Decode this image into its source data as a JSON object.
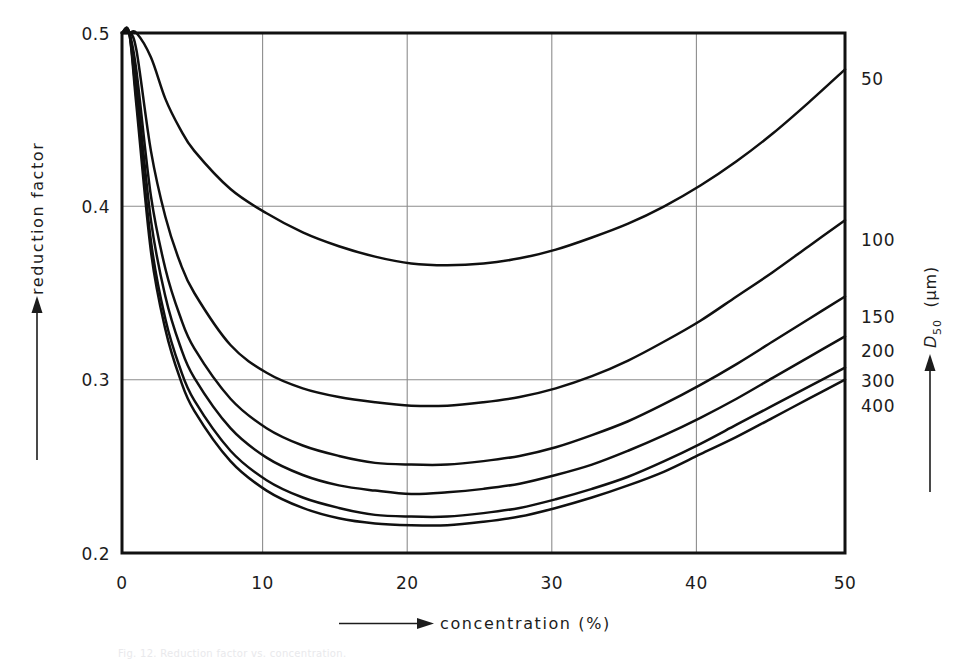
{
  "figure": {
    "caption": "Fig. 12. Reduction factor vs. concentration.",
    "background_color": "#ffffff",
    "line_color": "#101010",
    "grid_color": "#8d8d8d"
  },
  "axes": {
    "x_title": "concentration  (%)",
    "y_title": "reduction factor",
    "right_title_main": "D",
    "right_title_sub": "50",
    "right_title_unit": "(µm)",
    "x_ticks": [
      "0",
      "10",
      "20",
      "30",
      "40",
      "50"
    ],
    "y_ticks": [
      "0.5",
      "0.4",
      "0.3",
      "0.2"
    ],
    "series_labels": [
      "50",
      "100",
      "150",
      "200",
      "300",
      "400"
    ]
  },
  "chart_data": {
    "type": "line",
    "title": "",
    "xlabel": "concentration (%)",
    "ylabel": "reduction factor",
    "xlim": [
      0,
      50
    ],
    "ylim": [
      0.2,
      0.5
    ],
    "xticks": [
      0,
      10,
      20,
      30,
      40,
      50
    ],
    "yticks": [
      0.2,
      0.3,
      0.4,
      0.5
    ],
    "grid": true,
    "legend": "right-edge curve labels (D50 in micrometres)",
    "legend_position": "right",
    "series_unit": "µm",
    "x": [
      0.5,
      1,
      2,
      3,
      4,
      5,
      7.5,
      10,
      12.5,
      15,
      17.5,
      20,
      22.5,
      25,
      27.5,
      30,
      32.5,
      35,
      37.5,
      40,
      42.5,
      45,
      47.5,
      50
    ],
    "series": [
      {
        "name": "50",
        "label": "50",
        "values": [
          0.5,
          0.5,
          0.486,
          0.462,
          0.445,
          0.432,
          0.41,
          0.396,
          0.385,
          0.377,
          0.371,
          0.367,
          0.366,
          0.367,
          0.37,
          0.375,
          0.382,
          0.39,
          0.4,
          0.412,
          0.426,
          0.442,
          0.46,
          0.479
        ]
      },
      {
        "name": "100",
        "label": "100",
        "values": [
          0.5,
          0.49,
          0.432,
          0.394,
          0.368,
          0.35,
          0.32,
          0.304,
          0.295,
          0.29,
          0.287,
          0.285,
          0.285,
          0.287,
          0.29,
          0.295,
          0.302,
          0.311,
          0.322,
          0.334,
          0.348,
          0.362,
          0.377,
          0.392
        ]
      },
      {
        "name": "150",
        "label": "150",
        "values": [
          0.5,
          0.478,
          0.406,
          0.364,
          0.337,
          0.318,
          0.289,
          0.272,
          0.262,
          0.256,
          0.252,
          0.251,
          0.251,
          0.253,
          0.256,
          0.261,
          0.268,
          0.276,
          0.286,
          0.297,
          0.309,
          0.322,
          0.335,
          0.348
        ]
      },
      {
        "name": "200",
        "label": "200",
        "values": [
          0.5,
          0.47,
          0.392,
          0.348,
          0.32,
          0.301,
          0.272,
          0.255,
          0.245,
          0.239,
          0.236,
          0.234,
          0.235,
          0.237,
          0.24,
          0.245,
          0.251,
          0.259,
          0.268,
          0.278,
          0.289,
          0.301,
          0.313,
          0.325
        ]
      },
      {
        "name": "300",
        "label": "300",
        "values": [
          0.5,
          0.462,
          0.38,
          0.335,
          0.307,
          0.288,
          0.259,
          0.242,
          0.232,
          0.226,
          0.222,
          0.221,
          0.221,
          0.223,
          0.226,
          0.231,
          0.237,
          0.244,
          0.253,
          0.263,
          0.274,
          0.285,
          0.296,
          0.307
        ]
      },
      {
        "name": "400",
        "label": "400",
        "values": [
          0.5,
          0.458,
          0.374,
          0.329,
          0.301,
          0.282,
          0.253,
          0.236,
          0.226,
          0.22,
          0.217,
          0.216,
          0.216,
          0.218,
          0.221,
          0.226,
          0.232,
          0.239,
          0.247,
          0.257,
          0.267,
          0.278,
          0.289,
          0.3
        ]
      }
    ]
  }
}
